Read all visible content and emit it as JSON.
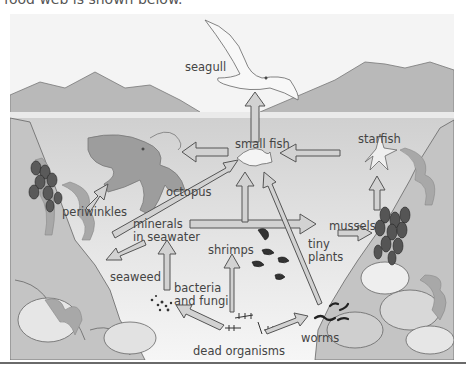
{
  "caption": "food web is shown below.",
  "diagram": {
    "nodes": {
      "seagull": "seagull",
      "small_fish": "small fish",
      "starfish": "starfish",
      "octopus": "octopus",
      "periwinkles": "periwinkles",
      "minerals_line1": "minerals",
      "minerals_line2": "in seawater",
      "mussels": "mussels",
      "shrimps": "shrimps",
      "tiny_plants_line1": "tiny",
      "tiny_plants_line2": "plants",
      "seaweed": "seaweed",
      "bacteria_line1": "bacteria",
      "bacteria_line2": "and fungi",
      "worms": "worms",
      "dead_organisms": "dead organisms"
    },
    "arrows": [
      {
        "from": "small fish",
        "to": "seagull"
      },
      {
        "from": "small fish",
        "to": "octopus"
      },
      {
        "from": "starfish",
        "to": "small fish"
      },
      {
        "from": "periwinkles",
        "to": "octopus"
      },
      {
        "from": "mussels",
        "to": "starfish"
      },
      {
        "from": "minerals in seawater",
        "to": "small fish"
      },
      {
        "from": "minerals in seawater",
        "to": "tiny plants"
      },
      {
        "from": "minerals in seawater",
        "to": "seaweed"
      },
      {
        "from": "shrimps",
        "to": "small fish"
      },
      {
        "from": "worms",
        "to": "small fish"
      },
      {
        "from": "tiny plants",
        "to": "mussels"
      },
      {
        "from": "bacteria and fungi",
        "to": "minerals in seawater"
      },
      {
        "from": "dead organisms",
        "to": "bacteria and fungi"
      },
      {
        "from": "dead organisms",
        "to": "shrimps"
      },
      {
        "from": "dead organisms",
        "to": "worms"
      }
    ],
    "colors": {
      "sky": "#f4f4f4",
      "mountains": "#b8b8b8",
      "water_top": "#cfcfcf",
      "water_bottom": "#f2f2f2",
      "rocks": "#bdbdbd",
      "arrow_fill": "#cfcfcf",
      "arrow_stroke": "#555555",
      "creature": "#9a9a9a"
    }
  }
}
